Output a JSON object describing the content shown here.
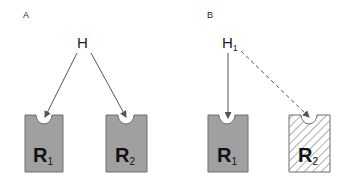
{
  "panels": [
    {
      "id": "A",
      "label": "A",
      "ligand": {
        "label": "H",
        "subscript": ""
      },
      "receptors": [
        {
          "label": "R",
          "subscript": "1",
          "fill": "solid",
          "arrow": "solid"
        },
        {
          "label": "R",
          "subscript": "2",
          "fill": "solid",
          "arrow": "solid"
        }
      ]
    },
    {
      "id": "B",
      "label": "B",
      "ligand": {
        "label": "H",
        "subscript": "1"
      },
      "receptors": [
        {
          "label": "R",
          "subscript": "1",
          "fill": "solid",
          "arrow": "solid"
        },
        {
          "label": "R",
          "subscript": "2",
          "fill": "hatched",
          "arrow": "dashed"
        }
      ]
    }
  ],
  "colors": {
    "receptor_fill": "#a0a0a0",
    "receptor_stroke": "#6e6e6e",
    "arrow": "#555555",
    "hatch": "#777777",
    "text": "#222222"
  }
}
